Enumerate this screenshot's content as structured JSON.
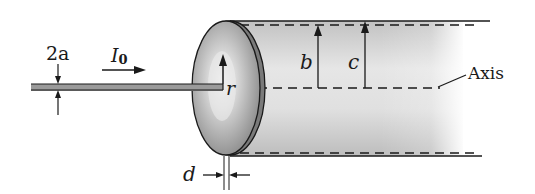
{
  "diagram": {
    "labels": {
      "wire_diameter": "2a",
      "current": "I",
      "current_subscript": "0",
      "radius": "r",
      "inner_radius": "b",
      "outer_radius": "c",
      "axis": "Axis",
      "thickness": "d"
    },
    "colors": {
      "line": "#1a1a1a",
      "disk_fill": "#9e9e9e",
      "disk_highlight": "#e6e6e6",
      "cylinder_fill": "#cfcfcf",
      "background": "#ffffff"
    }
  }
}
